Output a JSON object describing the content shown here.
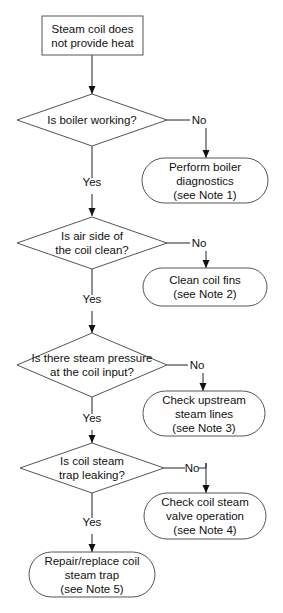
{
  "colors": {
    "background": "#ffffff",
    "stroke": "#555555",
    "connector": "#222222",
    "text": "#111111"
  },
  "nodes": [
    {
      "id": "start",
      "type": "process",
      "x": 42,
      "y": 16,
      "w": 101,
      "h": 39,
      "lines": [
        "Steam coil does",
        "not provide heat"
      ]
    },
    {
      "id": "q1",
      "type": "decision",
      "cx": 92,
      "cy": 120,
      "hw": 75,
      "hh": 26,
      "lines": [
        "Is boiler working?"
      ]
    },
    {
      "id": "a1",
      "type": "terminal",
      "x": 142,
      "y": 158,
      "w": 126,
      "h": 45,
      "lines": [
        "Perform boiler",
        "diagnostics",
        "(see Note 1)"
      ]
    },
    {
      "id": "q2",
      "type": "decision",
      "cx": 92,
      "cy": 243,
      "hw": 75,
      "hh": 26,
      "lines": [
        "Is air side of",
        "the coil clean?"
      ]
    },
    {
      "id": "a2",
      "type": "terminal",
      "x": 143,
      "y": 268,
      "w": 124,
      "h": 38,
      "lines": [
        "Clean coil fins",
        "(see Note 2)"
      ]
    },
    {
      "id": "q3",
      "type": "decision",
      "cx": 92,
      "cy": 365,
      "hw": 75,
      "hh": 32,
      "lines": [
        "Is there steam pressure",
        "at the coil input?"
      ]
    },
    {
      "id": "a3",
      "type": "terminal",
      "x": 143,
      "y": 391,
      "w": 122,
      "h": 45,
      "lines": [
        "Check upstream",
        "steam lines",
        "(see Note 3)"
      ]
    },
    {
      "id": "q4",
      "type": "decision",
      "cx": 92,
      "cy": 468,
      "hw": 72,
      "hh": 25,
      "lines": [
        "Is coil steam",
        "trap leaking?"
      ]
    },
    {
      "id": "a4",
      "type": "terminal",
      "x": 144,
      "y": 493,
      "w": 122,
      "h": 46,
      "lines": [
        "Check coil steam",
        "valve operation",
        "(see Note 4)"
      ]
    },
    {
      "id": "a5",
      "type": "terminal",
      "x": 29,
      "y": 552,
      "w": 126,
      "h": 45,
      "lines": [
        "Repair/replace coil",
        "steam trap",
        "(see Note 5)"
      ]
    }
  ],
  "edges": [
    {
      "from": "start",
      "to": "q1",
      "label": "",
      "points": [
        [
          92,
          55
        ],
        [
          92,
          94
        ]
      ]
    },
    {
      "from": "q1",
      "to": "a1",
      "label": "No",
      "label_x": 199,
      "label_y": 124,
      "points": [
        [
          167,
          120
        ],
        [
          190,
          120
        ]
      ],
      "drop": [
        [
          206,
          128
        ],
        [
          206,
          158
        ]
      ]
    },
    {
      "from": "q1",
      "to": "q2",
      "label": "Yes",
      "label_x": 92,
      "label_y": 186,
      "points": [
        [
          92,
          146
        ],
        [
          92,
          178
        ]
      ],
      "drop": [
        [
          92,
          194
        ],
        [
          92,
          216
        ]
      ]
    },
    {
      "from": "q2",
      "to": "a2",
      "label": "No",
      "label_x": 199,
      "label_y": 247,
      "points": [
        [
          167,
          243
        ],
        [
          190,
          243
        ]
      ],
      "drop": [
        [
          206,
          251
        ],
        [
          206,
          268
        ]
      ]
    },
    {
      "from": "q2",
      "to": "q3",
      "label": "Yes",
      "label_x": 92,
      "label_y": 303,
      "points": [
        [
          92,
          269
        ],
        [
          92,
          295
        ]
      ],
      "drop": [
        [
          92,
          311
        ],
        [
          92,
          333
        ]
      ]
    },
    {
      "from": "q3",
      "to": "a3",
      "label": "No",
      "label_x": 197,
      "label_y": 369,
      "points": [
        [
          167,
          365
        ],
        [
          188,
          365
        ]
      ],
      "drop": [
        [
          203,
          373
        ],
        [
          203,
          391
        ]
      ]
    },
    {
      "from": "q3",
      "to": "q4",
      "label": "Yes",
      "label_x": 92,
      "label_y": 422,
      "points": [
        [
          92,
          397
        ],
        [
          92,
          414
        ]
      ],
      "drop": [
        [
          92,
          430
        ],
        [
          92,
          443
        ]
      ]
    },
    {
      "from": "q4",
      "to": "a4",
      "label": "No",
      "label_x": 192,
      "label_y": 472,
      "points": [
        [
          164,
          468
        ],
        [
          185,
          468
        ]
      ],
      "drop": [
        [
          206,
          463
        ],
        [
          206,
          493
        ]
      ]
    },
    {
      "from": "q4",
      "to": "a5",
      "label": "Yes",
      "label_x": 92,
      "label_y": 526,
      "points": [
        [
          92,
          493
        ],
        [
          92,
          518
        ]
      ],
      "drop": [
        [
          92,
          534
        ],
        [
          92,
          552
        ]
      ]
    }
  ],
  "notes": {
    "q4_no_hook": [
      [
        199,
        468
      ],
      [
        206,
        468
      ],
      [
        206,
        463
      ]
    ]
  }
}
